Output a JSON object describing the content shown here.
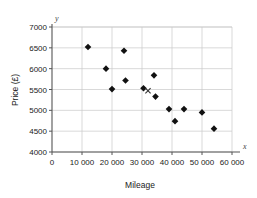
{
  "chart_data": {
    "type": "scatter",
    "title": "",
    "xlabel": "Mileage",
    "ylabel": "Price (£)",
    "x_axis_symbol": "x",
    "y_axis_symbol": "y",
    "xlim": [
      0,
      60000
    ],
    "ylim": [
      4000,
      7000
    ],
    "xticks": [
      0,
      10000,
      20000,
      30000,
      40000,
      50000,
      60000
    ],
    "xtick_labels": [
      "0",
      "10 000",
      "20 000",
      "30 000",
      "40 000",
      "50 000",
      "60 000"
    ],
    "yticks": [
      4000,
      4500,
      5000,
      5500,
      6000,
      6500,
      7000
    ],
    "ytick_labels": [
      "4000",
      "4500",
      "5000",
      "5500",
      "6000",
      "6500",
      "7000"
    ],
    "grid": true,
    "legend": "none",
    "marker": "diamond",
    "marker_color": "#111111",
    "points": [
      {
        "x": 12000,
        "y": 6520
      },
      {
        "x": 18000,
        "y": 6000
      },
      {
        "x": 20000,
        "y": 5510
      },
      {
        "x": 24000,
        "y": 6430
      },
      {
        "x": 24500,
        "y": 5715
      },
      {
        "x": 30500,
        "y": 5530
      },
      {
        "x": 34000,
        "y": 5840
      },
      {
        "x": 34500,
        "y": 5330
      },
      {
        "x": 39000,
        "y": 5030
      },
      {
        "x": 41000,
        "y": 4740
      },
      {
        "x": 44000,
        "y": 5030
      },
      {
        "x": 50000,
        "y": 4950
      },
      {
        "x": 54000,
        "y": 4560
      }
    ],
    "annotations": [
      {
        "label": "×",
        "marker": "cross",
        "x": 32000,
        "y": 5470,
        "color": "#333333"
      }
    ]
  }
}
